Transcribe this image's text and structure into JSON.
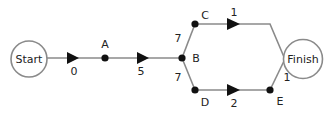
{
  "diagram": {
    "type": "network / critical path diagram",
    "colors": {
      "edge": "#8a8a8a",
      "node": "#111111",
      "text": "#222222",
      "background": "#ffffff"
    },
    "terminals": {
      "start": {
        "label": "Start"
      },
      "finish": {
        "label": "Finish"
      }
    },
    "nodes": {
      "A": {
        "label": "A"
      },
      "B": {
        "label": "B"
      },
      "C": {
        "label": "C"
      },
      "D": {
        "label": "D"
      },
      "E": {
        "label": "E"
      }
    },
    "edges": {
      "start_a": {
        "from": "Start",
        "to": "A",
        "weight": "0"
      },
      "a_b": {
        "from": "A",
        "to": "B",
        "weight": "5"
      },
      "b_c": {
        "from": "B",
        "to": "C",
        "weight": "7"
      },
      "b_d": {
        "from": "B",
        "to": "D",
        "weight": "7"
      },
      "c_finish": {
        "from": "C",
        "to": "Finish",
        "weight": "1"
      },
      "d_e": {
        "from": "D",
        "to": "E",
        "weight": "2"
      },
      "e_finish": {
        "from": "E",
        "to": "Finish",
        "weight": "1"
      }
    }
  }
}
